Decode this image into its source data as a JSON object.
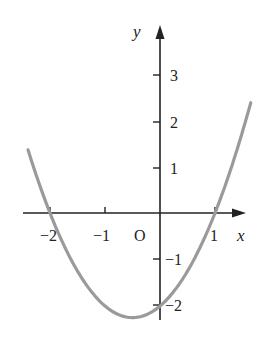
{
  "chart_data": {
    "type": "line",
    "title": "",
    "xlabel": "x",
    "ylabel": "y",
    "origin_label": "O",
    "function": "y = x^2 + x - 2",
    "x_ticks": [
      -2,
      -1,
      1
    ],
    "x_tick_labels": [
      "−2",
      "−1",
      "1"
    ],
    "y_ticks": [
      3,
      2,
      1,
      -1,
      -2
    ],
    "y_tick_labels": [
      "3",
      "2",
      "1",
      "−1",
      "−2"
    ],
    "xlim": [
      -2.4,
      2.4
    ],
    "ylim": [
      -2.4,
      3.9
    ],
    "grid": false,
    "legend": false,
    "series": [
      {
        "name": "parabola",
        "color": "#9a9a9a",
        "x": [
          -2.4,
          -2,
          -1.5,
          -1,
          -0.5,
          0,
          0.5,
          1,
          1.5,
          1.65
        ],
        "y": [
          1.36,
          0,
          -1.25,
          -2,
          -2.25,
          -2,
          -1.25,
          0,
          1.75,
          2.37
        ]
      }
    ],
    "key_points": {
      "roots": [
        -2,
        1
      ],
      "y_intercept": -2,
      "vertex": [
        -0.5,
        -2.25
      ]
    }
  },
  "colors": {
    "axis": "#222222",
    "curve": "#9a9a9a",
    "background": "#ffffff"
  }
}
